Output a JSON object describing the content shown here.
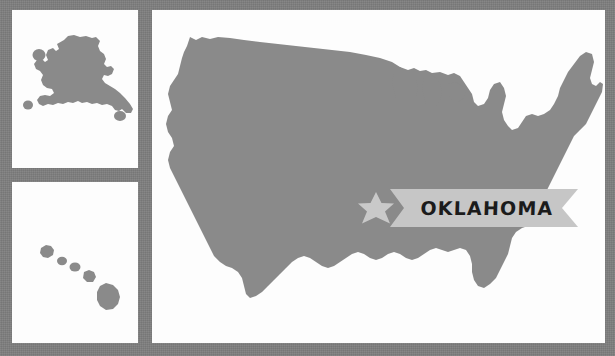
{
  "canvas": {
    "width": 615,
    "height": 356
  },
  "colors": {
    "background": "#7e7e7e",
    "panel": "#fdfdfd",
    "map_fill": "#8a8a8a",
    "star_fill": "#c9c9c9",
    "banner_fill": "#c6c6c6",
    "banner_text": "#1b1b1b"
  },
  "map": {
    "title": "OKLAHOMA",
    "highlighted_state": "OKLAHOMA",
    "marker": "six-pointed-star",
    "panels": [
      {
        "name": "alaska-inset",
        "region": "Alaska"
      },
      {
        "name": "hawaii-inset",
        "region": "Hawaii"
      },
      {
        "name": "contiguous-united-states",
        "region": "Contiguous United States"
      }
    ]
  },
  "banner": {
    "label": "OKLAHOMA"
  }
}
